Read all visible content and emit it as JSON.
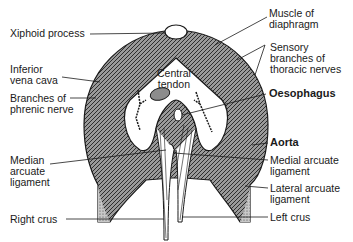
{
  "colors": {
    "ink": "#1a1a1a",
    "muscle_fill": "#7a7a7a",
    "muscle_dark": "#3c3c3c",
    "tendon_fill": "#ffffff",
    "ivc_fill": "#8c8c8c",
    "background": "#ffffff"
  },
  "labels": {
    "xiphoid_process": "Xiphoid process",
    "inferior_vena_cava": "Inferior\nvena cava",
    "branches_phrenic": "Branches of\nphrenic nerve",
    "median_arcuate": "Median\narcuate\nligament",
    "right_crus": "Right crus",
    "muscle_of_diaphragm": "Muscle of\ndiaphragm",
    "sensory_branches": "Sensory\nbranches of\nthoracic nerves",
    "oesophagus": "Oesophagus",
    "aorta": "Aorta",
    "medial_arcuate": "Medial arcuate\nligament",
    "lateral_arcuate": "Lateral arcuate\nligament",
    "left_crus": "Left crus",
    "central_tendon": "Central\ntendon"
  }
}
